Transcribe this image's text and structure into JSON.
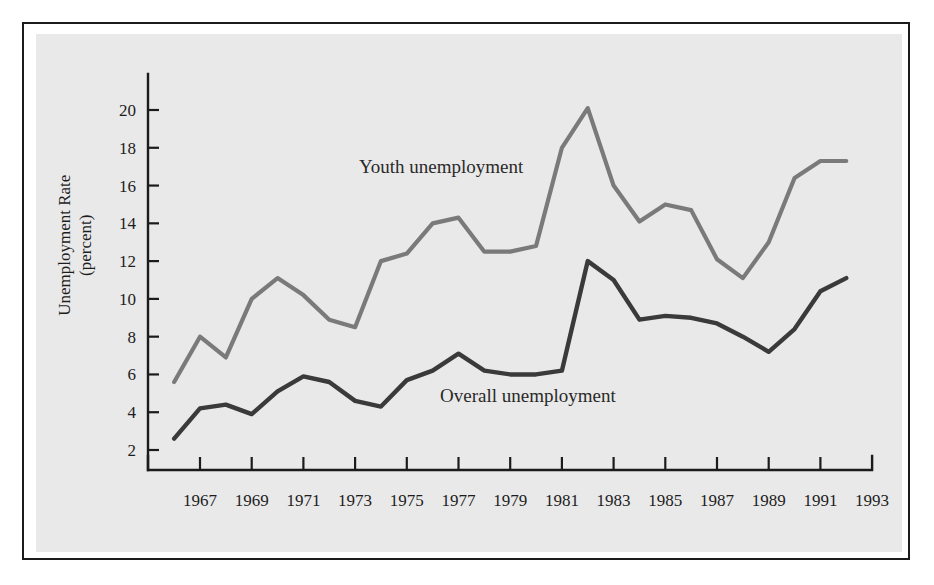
{
  "figure": {
    "background_color": "#e9e9e9",
    "frame_color": "#1b1b1b"
  },
  "axes": {
    "y_label_line1": "Unemployment Rate",
    "y_label_line2": "(percent)",
    "y_ticks": [
      2,
      4,
      6,
      8,
      10,
      12,
      14,
      16,
      18,
      20
    ],
    "x_ticks": [
      1967,
      1969,
      1971,
      1973,
      1975,
      1977,
      1979,
      1981,
      1983,
      1985,
      1987,
      1989,
      1991,
      1993
    ]
  },
  "annotations": {
    "youth": "Youth unemployment",
    "overall": "Overall unemployment"
  },
  "chart_data": {
    "type": "line",
    "title": "",
    "xlabel": "",
    "ylabel": "Unemployment Rate (percent)",
    "xlim": [
      1966,
      1993
    ],
    "ylim": [
      0,
      21
    ],
    "ytick_values": [
      2,
      4,
      6,
      8,
      10,
      12,
      14,
      16,
      18,
      20
    ],
    "xtick_values": [
      1967,
      1969,
      1971,
      1973,
      1975,
      1977,
      1979,
      1981,
      1983,
      1985,
      1987,
      1989,
      1991,
      1993
    ],
    "grid": false,
    "legend_position": "inline-annotations",
    "x": [
      1966,
      1967,
      1968,
      1969,
      1970,
      1971,
      1972,
      1973,
      1974,
      1975,
      1976,
      1977,
      1978,
      1979,
      1980,
      1981,
      1982,
      1983,
      1984,
      1985,
      1986,
      1987,
      1988,
      1989,
      1990,
      1991,
      1992
    ],
    "series": [
      {
        "name": "Youth unemployment",
        "color": "#7a7a7a",
        "values": [
          5.6,
          8.0,
          6.9,
          10.0,
          11.1,
          10.2,
          8.9,
          8.5,
          12.0,
          12.4,
          14.0,
          14.3,
          12.5,
          12.5,
          12.8,
          18.0,
          20.1,
          16.0,
          14.1,
          15.0,
          14.7,
          12.1,
          11.1,
          13.0,
          16.4,
          17.3,
          17.3
        ]
      },
      {
        "name": "Overall unemployment",
        "color": "#3a3a3a",
        "values": [
          2.6,
          4.2,
          4.4,
          3.9,
          5.1,
          5.9,
          5.6,
          4.6,
          4.3,
          5.7,
          6.2,
          7.1,
          6.2,
          6.0,
          6.0,
          6.2,
          12.0,
          11.0,
          8.9,
          9.1,
          9.0,
          8.7,
          8.0,
          7.2,
          8.4,
          10.4,
          11.1
        ]
      }
    ]
  }
}
